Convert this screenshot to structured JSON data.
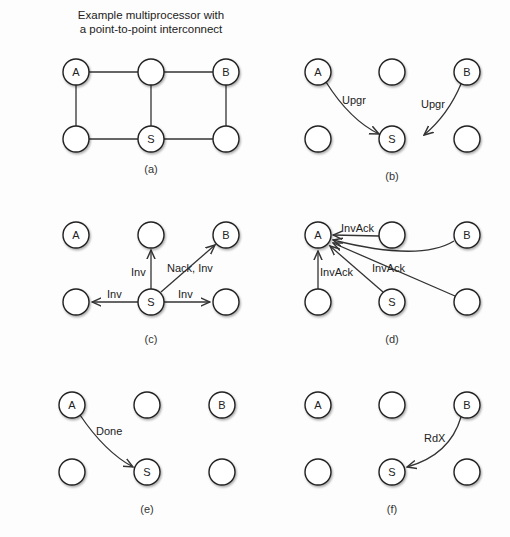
{
  "title": {
    "line1": "Example multiprocessor with",
    "line2": "a point-to-point interconnect"
  },
  "nodes": {
    "A": "A",
    "B": "B",
    "S": "S"
  },
  "panels": [
    {
      "id": "a",
      "caption": "(a)",
      "description": "Grid topology of six nodes with links"
    },
    {
      "id": "b",
      "caption": "(b)",
      "messages": [
        {
          "from": "A",
          "to": "S",
          "label": "Upgr"
        },
        {
          "from": "B",
          "to": "S",
          "label": "Upgr"
        }
      ]
    },
    {
      "id": "c",
      "caption": "(c)",
      "messages": [
        {
          "from": "S",
          "to": "top-middle",
          "label": "Inv"
        },
        {
          "from": "S",
          "to": "B",
          "label": "Nack, Inv"
        },
        {
          "from": "S",
          "to": "bottom-left",
          "label": "Inv"
        },
        {
          "from": "S",
          "to": "bottom-right",
          "label": "Inv"
        }
      ]
    },
    {
      "id": "d",
      "caption": "(d)",
      "messages": [
        {
          "from": "top-middle",
          "to": "A",
          "label": "InvAck"
        },
        {
          "from": "B",
          "to": "A",
          "label": ""
        },
        {
          "from": "bottom-left",
          "to": "A",
          "label": "InvAck"
        },
        {
          "from": "S",
          "to": "A",
          "label": ""
        },
        {
          "from": "bottom-right",
          "to": "A",
          "label": "InvAck"
        }
      ]
    },
    {
      "id": "e",
      "caption": "(e)",
      "messages": [
        {
          "from": "A",
          "to": "S",
          "label": "Done"
        }
      ]
    },
    {
      "id": "f",
      "caption": "(f)",
      "messages": [
        {
          "from": "B",
          "to": "S",
          "label": "RdX"
        }
      ]
    }
  ],
  "labels": {
    "b_upgr_a": "Upgr",
    "b_upgr_b": "Upgr",
    "c_inv_up": "Inv",
    "c_nack_inv": "Nack, Inv",
    "c_inv_left": "Inv",
    "c_inv_right": "Inv",
    "d_invack_top": "InvAck",
    "d_invack_left": "InvAck",
    "d_invack_mid": "InvAck",
    "e_done": "Done",
    "f_rdx": "RdX"
  },
  "captions": {
    "a": "(a)",
    "b": "(b)",
    "c": "(c)",
    "d": "(d)",
    "e": "(e)",
    "f": "(f)"
  }
}
